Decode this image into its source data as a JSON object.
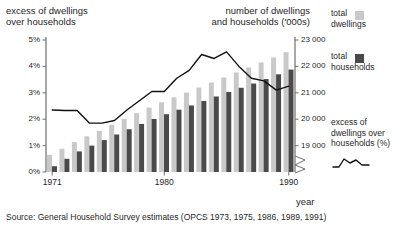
{
  "titles": {
    "left": "excess of dwellings\nover households",
    "right": "number of dwellings\nand households ('000s)"
  },
  "axes": {
    "x": {
      "label": "year",
      "ticks": [
        "1971",
        "1980",
        "1990"
      ],
      "tick_years": [
        1971,
        1980,
        1990
      ],
      "range": [
        1971,
        1990
      ]
    },
    "y_left": {
      "ticks": [
        "0%",
        "1%",
        "2%",
        "3%",
        "4%",
        "5%"
      ],
      "tick_values": [
        0,
        1,
        2,
        3,
        4,
        5
      ],
      "range": [
        0,
        5
      ]
    },
    "y_right": {
      "ticks": [
        "19 000",
        "20 000",
        "21 000",
        "22 000",
        "23 000"
      ],
      "tick_values": [
        19000,
        20000,
        21000,
        22000,
        23000
      ],
      "range": [
        18000,
        23000
      ],
      "broken_axis": true
    }
  },
  "legend": {
    "items": [
      {
        "label": "total\ndwellings",
        "color": "#c9c9c9",
        "type": "swatch"
      },
      {
        "label": "total\nhouseholds",
        "color": "#4a4a4a",
        "type": "swatch"
      },
      {
        "label": "excess of\ndwellings over\nhouseholds (%)",
        "color": "#111111",
        "type": "line"
      }
    ]
  },
  "source": "Source: General Household Survey estimates (OPCS 1973, 1975, 1986, 1989, 1991)",
  "colors": {
    "dwellings": "#c9c9c9",
    "households": "#4a4a4a",
    "line": "#111111",
    "axis": "#6f6f6f",
    "text": "#1f1f1f"
  },
  "chart_data": {
    "type": "bar",
    "title": "excess of dwellings over households",
    "xlabel": "year",
    "ylabel": "number of dwellings and households ('000s)",
    "ylabel_secondary": "excess of dwellings over households (%)",
    "categories": [
      "1971",
      "1972",
      "1973",
      "1974",
      "1975",
      "1976",
      "1977",
      "1978",
      "1979",
      "1980",
      "1981",
      "1982",
      "1983",
      "1984",
      "1985",
      "1986",
      "1987",
      "1988",
      "1989",
      "1990"
    ],
    "ylim": [
      18000,
      23000
    ],
    "ylim_secondary": [
      0,
      5
    ],
    "grid": false,
    "legend_position": "right",
    "series": [
      {
        "name": "total dwellings",
        "type": "bar",
        "color": "#c9c9c9",
        "axis": "right",
        "unit": "'000s",
        "values": [
          18650,
          18880,
          19130,
          19350,
          19560,
          19790,
          20010,
          20230,
          20440,
          20640,
          20830,
          21010,
          21200,
          21390,
          21580,
          21770,
          21960,
          22150,
          22340,
          22540
        ]
      },
      {
        "name": "total households",
        "type": "bar",
        "color": "#4a4a4a",
        "axis": "right",
        "unit": "'000s",
        "values": [
          18220,
          18500,
          18780,
          19000,
          19210,
          19420,
          19620,
          19820,
          20010,
          20190,
          20360,
          20520,
          20690,
          20860,
          21030,
          21190,
          21350,
          21520,
          21700,
          21880
        ]
      },
      {
        "name": "excess of dwellings over households (%)",
        "type": "line",
        "color": "#111111",
        "axis": "left",
        "unit": "%",
        "values": [
          2.35,
          2.33,
          2.33,
          1.85,
          1.85,
          1.95,
          2.35,
          2.7,
          3.05,
          3.05,
          3.55,
          3.85,
          4.45,
          4.3,
          4.55,
          4.0,
          3.55,
          3.45,
          3.1,
          3.25
        ]
      }
    ]
  }
}
